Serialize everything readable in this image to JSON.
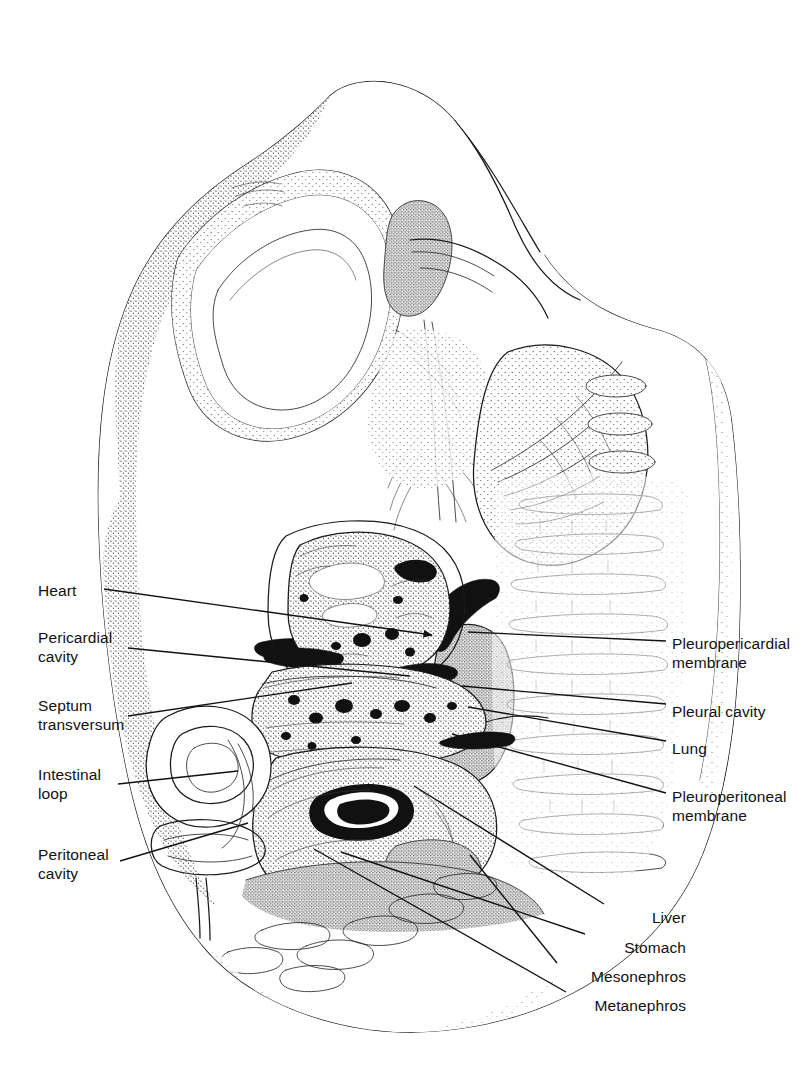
{
  "figure": {
    "kind": "anatomical-line-drawing",
    "style": "stippled pen-and-ink line illustration, black on white"
  },
  "labels_left": [
    {
      "id": "heart",
      "text": "Heart",
      "x": 38,
      "y": 581,
      "lines": 1
    },
    {
      "id": "pericardial-cavity",
      "text": "Pericardial\ncavity",
      "x": 38,
      "y": 628,
      "lines": 2
    },
    {
      "id": "septum-transversum",
      "text": "Septum\ntransversum",
      "x": 38,
      "y": 696,
      "lines": 2
    },
    {
      "id": "intestinal-loop",
      "text": "Intestinal\nloop",
      "x": 38,
      "y": 765,
      "lines": 2
    },
    {
      "id": "peritoneal-cavity",
      "text": "Peritoneal\ncavity",
      "x": 38,
      "y": 845,
      "lines": 2
    }
  ],
  "labels_right": [
    {
      "id": "pleuropericardial-membrane",
      "text": "Pleuropericardial\nmembrane",
      "x": 672,
      "y": 634,
      "lines": 2
    },
    {
      "id": "pleural-cavity",
      "text": "Pleural  cavity",
      "x": 672,
      "y": 702,
      "lines": 1
    },
    {
      "id": "lung",
      "text": "Lung",
      "x": 672,
      "y": 739,
      "lines": 1
    },
    {
      "id": "pleuroperitoneal-membrane",
      "text": "Pleuroperitoneal\nmembrane",
      "x": 672,
      "y": 787,
      "lines": 2
    }
  ],
  "labels_bottom_right": [
    {
      "id": "liver",
      "text": "Liver",
      "right": 686,
      "y": 908
    },
    {
      "id": "stomach",
      "text": "Stomach",
      "right": 686,
      "y": 938
    },
    {
      "id": "mesonephros",
      "text": "Mesonephros",
      "right": 686,
      "y": 967
    },
    {
      "id": "metanephros",
      "text": "Metanephros",
      "right": 686,
      "y": 996
    }
  ],
  "leaders": [
    {
      "id": "leader-heart",
      "from": [
        104,
        589
      ],
      "to": [
        432,
        635
      ],
      "arrow": true
    },
    {
      "id": "leader-pericardial-cavity",
      "from": [
        128,
        648
      ],
      "to": [
        410,
        676
      ],
      "arrow": false
    },
    {
      "id": "leader-septum-transversum",
      "from": [
        128,
        716
      ],
      "to": [
        352,
        683
      ],
      "arrow": false
    },
    {
      "id": "leader-intestinal-loop",
      "from": [
        118,
        784
      ],
      "to": [
        238,
        771
      ],
      "arrow": false
    },
    {
      "id": "leader-peritoneal-cavity",
      "from": [
        120,
        861
      ],
      "to": [
        248,
        823
      ],
      "arrow": false
    },
    {
      "id": "leader-pleuropericardial",
      "from": [
        666,
        641
      ],
      "to": [
        468,
        632
      ],
      "arrow": false
    },
    {
      "id": "leader-pleural-cavity",
      "from": [
        666,
        704
      ],
      "to": [
        462,
        686
      ],
      "arrow": false
    },
    {
      "id": "leader-lung",
      "from": [
        666,
        741
      ],
      "to": [
        468,
        707
      ],
      "arrow": false
    },
    {
      "id": "leader-pleuroperitoneal",
      "from": [
        666,
        793
      ],
      "to": [
        452,
        734
      ],
      "arrow": false
    },
    {
      "id": "leader-liver",
      "from": [
        604,
        904
      ],
      "to": [
        414,
        786
      ],
      "arrow": false
    },
    {
      "id": "leader-stomach",
      "from": [
        585,
        934
      ],
      "to": [
        341,
        852
      ],
      "arrow": false
    },
    {
      "id": "leader-mesonephros",
      "from": [
        557,
        963
      ],
      "to": [
        470,
        855
      ],
      "arrow": false
    },
    {
      "id": "leader-metanephros",
      "from": [
        566,
        992
      ],
      "to": [
        314,
        849
      ],
      "arrow": false
    }
  ],
  "colors": {
    "ink": "#1a1a1a",
    "paper": "#ffffff",
    "leader": "#111111"
  }
}
